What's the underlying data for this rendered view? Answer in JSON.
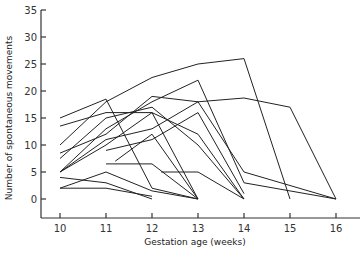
{
  "chart_data": {
    "type": "line",
    "title": "",
    "xlabel": "Gestation age (weeks)",
    "ylabel": "Number of spontaneous movements",
    "xlim": [
      10,
      16
    ],
    "ylim": [
      0,
      35
    ],
    "x_ticks": [
      10,
      11,
      12,
      13,
      14,
      15,
      16
    ],
    "y_ticks": [
      0,
      5,
      10,
      15,
      20,
      25,
      30,
      35
    ],
    "grid": false,
    "legend": null,
    "series": [
      {
        "name": "fetus-1",
        "points": [
          [
            10,
            15
          ],
          [
            11,
            18.5
          ],
          [
            12,
            2
          ],
          [
            13,
            0
          ]
        ]
      },
      {
        "name": "fetus-2",
        "points": [
          [
            10,
            13.5
          ],
          [
            11,
            16
          ],
          [
            12,
            16
          ],
          [
            13,
            12
          ],
          [
            14,
            0
          ]
        ]
      },
      {
        "name": "fetus-3",
        "points": [
          [
            10,
            10
          ],
          [
            11,
            18
          ],
          [
            12,
            22.5
          ],
          [
            13,
            25
          ],
          [
            14,
            26
          ],
          [
            15,
            0
          ]
        ]
      },
      {
        "name": "fetus-4",
        "points": [
          [
            10,
            8.5
          ],
          [
            11,
            12
          ],
          [
            12,
            19
          ],
          [
            13,
            18
          ],
          [
            14,
            5
          ],
          [
            16,
            0
          ]
        ]
      },
      {
        "name": "fetus-5",
        "points": [
          [
            10,
            7.5
          ],
          [
            11,
            15
          ],
          [
            12,
            17
          ],
          [
            13,
            10
          ],
          [
            14,
            0
          ]
        ]
      },
      {
        "name": "fetus-6",
        "points": [
          [
            10,
            5
          ],
          [
            11,
            10
          ],
          [
            12,
            16
          ],
          [
            13,
            0
          ]
        ]
      },
      {
        "name": "fetus-7",
        "points": [
          [
            10,
            5
          ],
          [
            11,
            13
          ],
          [
            12,
            18
          ],
          [
            13,
            22
          ],
          [
            14,
            3
          ],
          [
            16,
            0
          ]
        ]
      },
      {
        "name": "fetus-8",
        "points": [
          [
            10,
            5
          ],
          [
            11,
            11
          ],
          [
            12,
            13
          ],
          [
            13,
            18
          ],
          [
            14,
            18.7
          ],
          [
            15,
            17
          ],
          [
            16,
            0
          ]
        ]
      },
      {
        "name": "fetus-9",
        "points": [
          [
            10,
            4
          ],
          [
            11,
            3
          ],
          [
            12,
            0
          ]
        ]
      },
      {
        "name": "fetus-10",
        "points": [
          [
            10,
            2
          ],
          [
            11,
            5
          ],
          [
            12,
            1.5
          ],
          [
            13,
            0
          ]
        ]
      },
      {
        "name": "fetus-11",
        "points": [
          [
            10,
            2
          ],
          [
            11,
            2
          ],
          [
            12,
            0.5
          ]
        ]
      },
      {
        "name": "fetus-12",
        "points": [
          [
            11,
            6.5
          ],
          [
            12,
            6.5
          ],
          [
            13,
            0
          ]
        ]
      },
      {
        "name": "fetus-13",
        "points": [
          [
            11.2,
            7
          ],
          [
            12,
            12
          ],
          [
            13,
            0
          ]
        ]
      },
      {
        "name": "fetus-14",
        "points": [
          [
            12.2,
            5
          ],
          [
            13,
            5
          ],
          [
            14,
            0
          ]
        ]
      },
      {
        "name": "fetus-15",
        "points": [
          [
            11,
            9
          ],
          [
            12,
            11
          ],
          [
            13,
            16
          ],
          [
            14,
            1
          ]
        ]
      }
    ]
  }
}
